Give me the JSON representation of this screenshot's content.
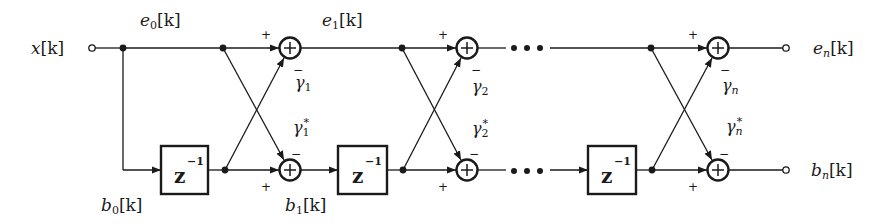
{
  "diagram": {
    "colors": {
      "stroke": "#1a1a1a",
      "background": "#ffffff"
    },
    "input": {
      "label": "x[k]",
      "base": "x",
      "index": "[k]"
    },
    "top_labels": [
      {
        "base": "e",
        "sub": "0",
        "index": "[k]"
      },
      {
        "base": "e",
        "sub": "1",
        "index": "[k]"
      }
    ],
    "bottom_labels": [
      {
        "base": "b",
        "sub": "0",
        "index": "[k]"
      },
      {
        "base": "b",
        "sub": "1",
        "index": "[k]"
      }
    ],
    "stages": [
      {
        "name": "stage-1",
        "gamma_sub": "1",
        "gamma_top": "γ",
        "gamma_bot": "γ",
        "conj": "*"
      },
      {
        "name": "stage-2",
        "gamma_sub": "2",
        "gamma_top": "γ",
        "gamma_bot": "γ",
        "conj": "*"
      },
      {
        "name": "stage-n",
        "gamma_sub": "n",
        "gamma_top": "γ",
        "gamma_bot": "γ",
        "conj": "*"
      }
    ],
    "delay": {
      "base": "z",
      "exp": "−1"
    },
    "adder_symbol": "+",
    "sign_plus": "+",
    "sign_minus": "−",
    "outputs": {
      "top": {
        "base": "e",
        "sub": "n",
        "index": "[k]"
      },
      "bottom": {
        "base": "b",
        "sub": "n",
        "index": "[k]"
      }
    }
  }
}
